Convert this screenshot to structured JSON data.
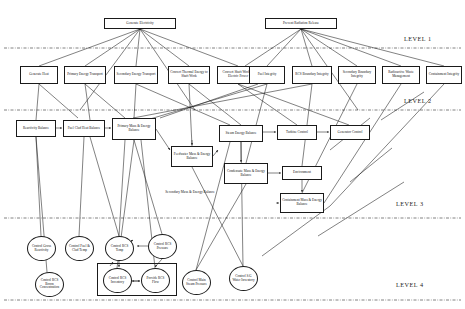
{
  "diagram": {
    "levels": [
      {
        "id": "level-1",
        "label": "LEVEL 1"
      },
      {
        "id": "level-2",
        "label": "LEVEL 2"
      },
      {
        "id": "level-3",
        "label": "LEVEL 3"
      },
      {
        "id": "level-4",
        "label": "LEVEL 4"
      }
    ],
    "level1_nodes": [
      {
        "id": "generate-electricity",
        "label": "Generate Electricity",
        "x": 104,
        "y": 18,
        "w": 72,
        "h": 11
      },
      {
        "id": "prevent-radiation-release",
        "label": "Prevent Radiation Release",
        "x": 265,
        "y": 18,
        "w": 72,
        "h": 11
      }
    ],
    "level2_nodes": [
      {
        "id": "generate-heat",
        "label": "Generate Heat",
        "x": 20,
        "y": 66,
        "w": 38,
        "h": 18
      },
      {
        "id": "primary-energy-transport",
        "label": "Primary Energy Transport",
        "x": 64,
        "y": 66,
        "w": 42,
        "h": 18
      },
      {
        "id": "secondary-energy-transport",
        "label": "Secondary Energy Transport",
        "x": 114,
        "y": 66,
        "w": 44,
        "h": 18
      },
      {
        "id": "convert-thermal-energy",
        "label": "Convert Thermal Energy to Shaft Work",
        "x": 168,
        "y": 66,
        "w": 42,
        "h": 18
      },
      {
        "id": "convert-shaft-work",
        "label": "Convert Shaft Work to Electric Power",
        "x": 217,
        "y": 66,
        "w": 42,
        "h": 18
      },
      {
        "id": "fuel-integrity",
        "label": "Fuel Integrity",
        "x": 249,
        "y": 66,
        "w": 36,
        "h": 18
      },
      {
        "id": "rcs-boundary-integrity",
        "label": "RCS Boundary Integrity",
        "x": 292,
        "y": 66,
        "w": 40,
        "h": 18
      },
      {
        "id": "secondary-boundary-integrity",
        "label": "Secondary Boundary Integrity",
        "x": 338,
        "y": 66,
        "w": 38,
        "h": 18
      },
      {
        "id": "radioactive-waste-management",
        "label": "Radioactive Waste Management",
        "x": 382,
        "y": 66,
        "w": 38,
        "h": 18
      },
      {
        "id": "containment-integrity",
        "label": "Containment Integrity",
        "x": 426,
        "y": 66,
        "w": 36,
        "h": 18
      }
    ],
    "level3_nodes": [
      {
        "id": "reactivity-balance",
        "label": "Reactivity Balance",
        "x": 16,
        "y": 120,
        "w": 40,
        "h": 17
      },
      {
        "id": "fuel-clad-heat-balance",
        "label": "Fuel Clad Heat Balance",
        "x": 63,
        "y": 120,
        "w": 42,
        "h": 17
      },
      {
        "id": "primary-mass-energy-balance",
        "label": "Primary Mass & Energy Balance",
        "x": 112,
        "y": 118,
        "w": 44,
        "h": 22
      },
      {
        "id": "steam-energy-balance",
        "label": "Steam Energy Balance",
        "x": 219,
        "y": 125,
        "w": 44,
        "h": 17
      },
      {
        "id": "turbine-control",
        "label": "Turbine Control",
        "x": 277,
        "y": 125,
        "w": 40,
        "h": 15
      },
      {
        "id": "generator-control",
        "label": "Generator Control",
        "x": 330,
        "y": 125,
        "w": 40,
        "h": 15
      },
      {
        "id": "feedwater-mass-energy-balance",
        "label": "Feedwater Mass & Energy Balance",
        "x": 171,
        "y": 146,
        "w": 42,
        "h": 21
      },
      {
        "id": "condensate-mass-energy-balance",
        "label": "Condensate Mass & Energy Balance",
        "x": 224,
        "y": 163,
        "w": 44,
        "h": 21
      },
      {
        "id": "environment",
        "label": "Environment",
        "x": 282,
        "y": 166,
        "w": 40,
        "h": 14
      },
      {
        "id": "containment-mass-energy-balance",
        "label": "Containment Mass & Energy Balance",
        "x": 280,
        "y": 193,
        "w": 44,
        "h": 20
      }
    ],
    "level3_label": {
      "id": "secondary-mass-energy-balance-label",
      "label": "Secondary Mass & Energy Balance",
      "x": 150,
      "y": 190
    },
    "level4_nodes": [
      {
        "id": "control-gross-reactivity",
        "label": "Control Gross Reactivity",
        "x": 27,
        "y": 236,
        "w": 29,
        "h": 25
      },
      {
        "id": "control-fuel-clad-temp",
        "label": "Control Fuel & Clad Temp",
        "x": 65,
        "y": 236,
        "w": 29,
        "h": 25
      },
      {
        "id": "control-rcs-temp",
        "label": "Control RCS Temp",
        "x": 105,
        "y": 236,
        "w": 29,
        "h": 25
      },
      {
        "id": "control-rcs-pressure",
        "label": "Control RCS Pressure",
        "x": 148,
        "y": 234,
        "w": 29,
        "h": 25
      },
      {
        "id": "control-rcs-boron-concentration",
        "label": "Control RCS Boron Concentration",
        "x": 35,
        "y": 272,
        "w": 29,
        "h": 25
      },
      {
        "id": "control-rcs-inventory",
        "label": "Control RCS Inventory",
        "x": 103,
        "y": 268,
        "w": 29,
        "h": 25
      },
      {
        "id": "provide-rcs-flow",
        "label": "Provide RCS Flow",
        "x": 141,
        "y": 268,
        "w": 29,
        "h": 25
      },
      {
        "id": "control-main-steam-pressure",
        "label": "Control Main Steam Pressure",
        "x": 182,
        "y": 270,
        "w": 29,
        "h": 25
      },
      {
        "id": "control-sg-water-inventory",
        "label": "Control S/G Water Inventory",
        "x": 229,
        "y": 266,
        "w": 29,
        "h": 25
      }
    ],
    "group_boxes": [
      {
        "id": "rcs-inventory-flow-group",
        "x": 97,
        "y": 263,
        "w": 78,
        "h": 31
      }
    ],
    "colors": {
      "line": "#1a1a1a",
      "text": "#111111",
      "background": "#ffffff"
    }
  }
}
